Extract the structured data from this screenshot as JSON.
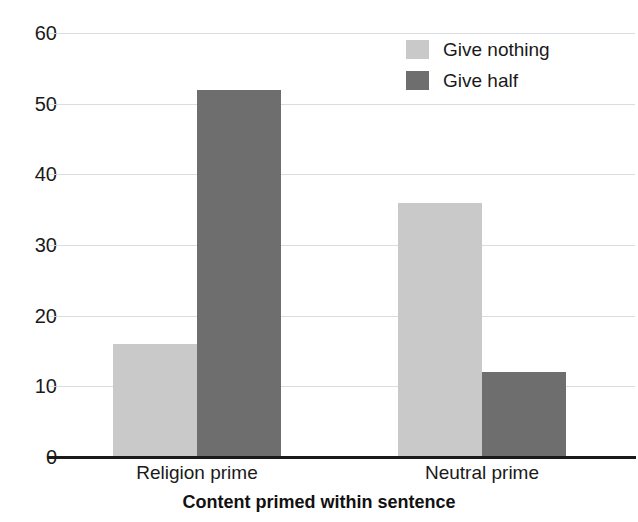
{
  "chart_data": {
    "type": "bar",
    "title": "",
    "subtitle": "",
    "xlabel": "Content primed within sentence",
    "ylabel": "",
    "categories": [
      "Religion prime",
      "Neutral prime"
    ],
    "series": [
      {
        "name": "Give nothing",
        "color": "#c9c9c9",
        "values": [
          16,
          36
        ]
      },
      {
        "name": "Give half",
        "color": "#6e6e6e",
        "values": [
          52,
          12
        ]
      }
    ],
    "ylim": [
      0,
      60
    ],
    "ytick_labels": [
      "0",
      "10",
      "20",
      "30",
      "40",
      "50",
      "60"
    ],
    "ytick_values": [
      0,
      10,
      20,
      30,
      40,
      50,
      60
    ],
    "grid": true,
    "grid_color": "#d9dde1",
    "legend_position": "top-right",
    "background": "#ffffff",
    "text_color": "#1a1a1a"
  },
  "legend": {
    "entries": [
      {
        "label": "Give nothing",
        "swatch": "legend-swatch-give-nothing"
      },
      {
        "label": "Give half",
        "swatch": "legend-swatch-give-half"
      }
    ]
  },
  "axes": {
    "x_title": "Content primed within sentence",
    "x_categories": [
      "Religion prime",
      "Neutral prime"
    ],
    "y_ticks": [
      "0",
      "10",
      "20",
      "30",
      "40",
      "50",
      "60"
    ]
  }
}
